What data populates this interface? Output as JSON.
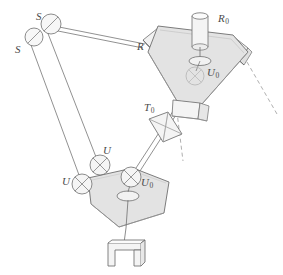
{
  "figure": {
    "kind": "mechanism-schematic",
    "width": 283,
    "height": 275,
    "background_color": "#ffffff",
    "line_color": "#6e6e6e",
    "dash_color": "#8d8d8d",
    "platform_fill": "#e3e3e3",
    "part_fill": "#f2f2f2",
    "label_color": "#4a4a4a"
  },
  "labels": [
    {
      "id": "s-upper",
      "text": "S",
      "sub": "",
      "x": 36,
      "y": 11,
      "name": "joint-label-s-upper"
    },
    {
      "id": "s-lower",
      "text": "S",
      "sub": "",
      "x": 15,
      "y": 44,
      "name": "joint-label-s-lower"
    },
    {
      "id": "r",
      "text": "R",
      "sub": "",
      "x": 137,
      "y": 41,
      "name": "joint-label-r"
    },
    {
      "id": "r0",
      "text": "R",
      "sub": "0",
      "x": 218,
      "y": 13,
      "name": "joint-label-r0"
    },
    {
      "id": "u0-upper",
      "text": "U",
      "sub": "0",
      "x": 207,
      "y": 67,
      "name": "joint-label-u0-upper"
    },
    {
      "id": "t0",
      "text": "T",
      "sub": "0",
      "x": 144,
      "y": 102,
      "name": "joint-label-t0"
    },
    {
      "id": "u-upper",
      "text": "U",
      "sub": "",
      "x": 103,
      "y": 145,
      "name": "joint-label-u-upper"
    },
    {
      "id": "u-lower",
      "text": "U",
      "sub": "",
      "x": 62,
      "y": 176,
      "name": "joint-label-u-lower"
    },
    {
      "id": "u0-lower",
      "text": "U",
      "sub": "0",
      "x": 141,
      "y": 177,
      "name": "joint-label-u0-lower"
    }
  ],
  "joints": {
    "spherical": [
      {
        "name": "spherical-joint-upper",
        "cx": 51,
        "cy": 24,
        "r": 10
      },
      {
        "name": "spherical-joint-lower",
        "cx": 34,
        "cy": 37,
        "r": 9
      }
    ],
    "universal": [
      {
        "name": "universal-joint-upper",
        "cx": 100,
        "cy": 165,
        "r": 10
      },
      {
        "name": "universal-joint-lower",
        "cx": 82,
        "cy": 184,
        "r": 10
      },
      {
        "name": "universal-joint-u0-lower",
        "cx": 131,
        "cy": 177,
        "r": 10
      },
      {
        "name": "universal-joint-u0-upper",
        "cx": 195,
        "cy": 76,
        "r": 9
      }
    ]
  },
  "components": {
    "upper_platform": "upper-triangular-platform",
    "lower_platform": "lower-hexagonal-platform",
    "actuator_cylinder": "rotary-actuator-cylinder",
    "prismatic_block": "prismatic-joint-block",
    "end_effector": "gripper-end-effector",
    "parallel_rods": "parallelogram-link-rods",
    "long_link": "long-connecting-link",
    "diagonal_link": "diagonal-connecting-link"
  },
  "guides": {
    "dashed_lines": [
      {
        "name": "dashed-axis-right",
        "x1": 249,
        "y1": 60,
        "x2": 276,
        "y2": 112
      },
      {
        "name": "dashed-axis-center",
        "x1": 177,
        "y1": 103,
        "x2": 182,
        "y2": 160
      }
    ]
  }
}
